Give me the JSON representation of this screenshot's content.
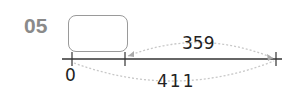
{
  "problem": {
    "number": "05"
  },
  "number_line": {
    "start_label": "0",
    "ticks": [
      "0",
      "?",
      "end"
    ],
    "blank_box": "",
    "top_arc_value": "359",
    "bottom_arc_value": "411"
  },
  "colors": {
    "number_label": "#8a8a8a",
    "line": "#333333",
    "dashed_arc": "#c8c8c8",
    "box_border": "#9a9a9a"
  }
}
